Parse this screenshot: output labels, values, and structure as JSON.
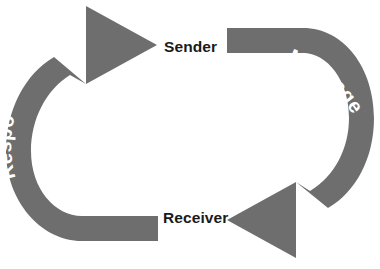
{
  "diagram": {
    "type": "cyclical-process",
    "background_color": "#ffffff",
    "arrow_color": "#6e6e6e",
    "node_label_color": "#1a1a1a",
    "arc_label_color": "#ffffff",
    "nodes": [
      {
        "id": "sender",
        "label": "Sender",
        "position": "top"
      },
      {
        "id": "receiver",
        "label": "Receiver",
        "position": "bottom"
      }
    ],
    "arrows": [
      {
        "id": "message",
        "label": "Message",
        "from": "sender",
        "to": "receiver",
        "side": "right",
        "direction": "clockwise",
        "reading": "top-to-bottom"
      },
      {
        "id": "response",
        "label": "Response",
        "from": "receiver",
        "to": "sender",
        "side": "left",
        "direction": "clockwise",
        "reading": "bottom-to-top"
      }
    ]
  }
}
